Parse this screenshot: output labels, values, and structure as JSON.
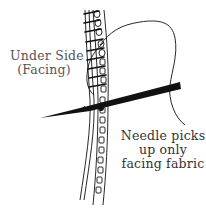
{
  "diagram": {
    "type": "sewing-illustration",
    "labels": {
      "under_side": [
        "Under Side",
        "(Facing)"
      ],
      "needle_note": [
        "Needle picks",
        "up only",
        "facing fabric"
      ]
    },
    "elements": [
      {
        "name": "facing-fabric-strip",
        "description": "Vertical double-lined fabric edge with small square loops"
      },
      {
        "name": "thread",
        "description": "Looping thread exiting top of stitches, curving right and down"
      },
      {
        "name": "needle",
        "description": "Black tapered needle pointing left, passing through facing"
      },
      {
        "name": "cross-stitches",
        "description": "Diagonal stitches along the upper seam"
      }
    ],
    "colors": {
      "ink": "#111111",
      "label_gray": "#555555",
      "label_dark": "#333333",
      "background": "#ffffff"
    }
  }
}
